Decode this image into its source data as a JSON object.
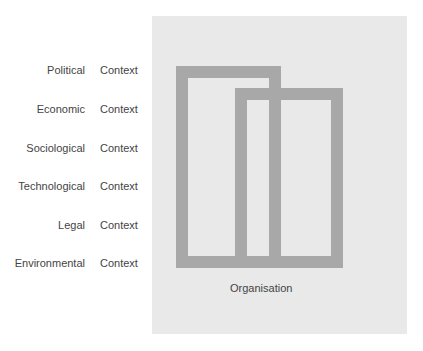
{
  "factors": [
    {
      "label": "Political",
      "context": "Context"
    },
    {
      "label": "Economic",
      "context": "Context"
    },
    {
      "label": "Sociological",
      "context": "Context"
    },
    {
      "label": "Technological",
      "context": "Context"
    },
    {
      "label": "Legal",
      "context": "Context"
    },
    {
      "label": "Environmental",
      "context": "Context"
    }
  ],
  "organisation_label": "Organisation",
  "colors": {
    "panel": "#e9e9e9",
    "frame": "#a8a8a8",
    "text": "#444444"
  }
}
